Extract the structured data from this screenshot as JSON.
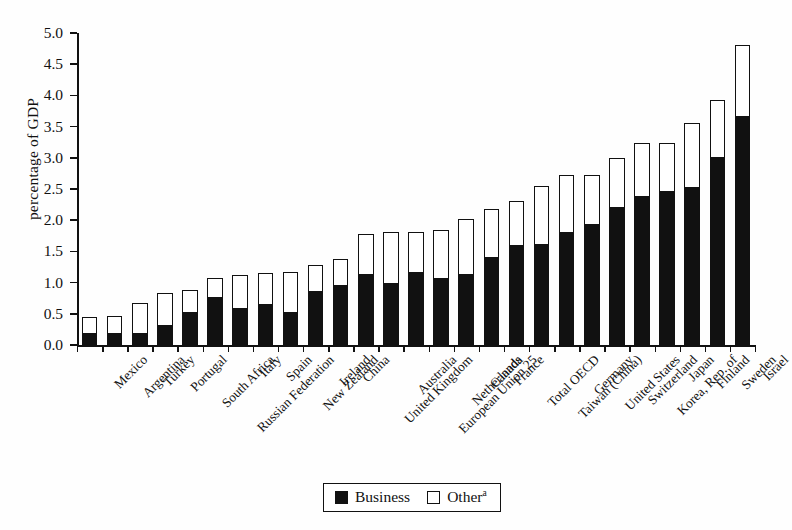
{
  "chart_data": {
    "type": "bar",
    "subtype": "stacked-vertical",
    "title": "",
    "xlabel": "",
    "ylabel": "percentage of GDP",
    "ylim": [
      0.0,
      5.0
    ],
    "ytick_step": 0.5,
    "ytick_labels": [
      "0.0",
      "0.5",
      "1.0",
      "1.5",
      "2.0",
      "2.5",
      "3.0",
      "3.5",
      "4.0",
      "4.5",
      "5.0"
    ],
    "grid": false,
    "legend_position": "bottom-center",
    "categories": [
      "Mexico",
      "Argentina",
      "Turkey",
      "Portugal",
      "South Africa",
      "Russian Federation",
      "Italy",
      "Spain",
      "New Zealand",
      "Ireland",
      "China",
      "United Kingdom",
      "Australia",
      "European Union 25",
      "Netherlands",
      "Canada",
      "France",
      "Total OECD",
      "Taiwan (China)",
      "Germany",
      "United States",
      "Switzerland",
      "Korea, Rep. of",
      "Japan",
      "Finland",
      "Sweden",
      "Israel"
    ],
    "series": [
      {
        "name": "Business",
        "color": "#111111",
        "values": [
          0.17,
          0.17,
          0.18,
          0.3,
          0.52,
          0.76,
          0.57,
          0.64,
          0.52,
          0.85,
          0.95,
          1.13,
          0.98,
          1.16,
          1.05,
          1.12,
          1.39,
          1.58,
          1.61,
          1.8,
          1.93,
          2.2,
          2.37,
          2.45,
          2.52,
          2.99,
          3.65
        ]
      },
      {
        "name": "Other",
        "color": "#ffffff",
        "values": [
          0.28,
          0.3,
          0.5,
          0.53,
          0.36,
          0.32,
          0.56,
          0.51,
          0.65,
          0.43,
          0.43,
          0.65,
          0.83,
          0.65,
          0.79,
          0.9,
          0.79,
          0.72,
          0.94,
          0.93,
          0.8,
          0.79,
          0.87,
          0.78,
          1.03,
          0.93,
          1.15
        ]
      }
    ],
    "totals": [
      0.45,
      0.47,
      0.68,
      0.83,
      0.88,
      1.08,
      1.13,
      1.15,
      1.17,
      1.28,
      1.38,
      1.78,
      1.81,
      1.81,
      1.84,
      2.02,
      2.18,
      2.3,
      2.55,
      2.73,
      2.73,
      2.99,
      3.24,
      3.23,
      3.55,
      3.92,
      4.8
    ]
  },
  "legend": {
    "items": [
      {
        "label": "Business",
        "swatch": "filled",
        "footnote": ""
      },
      {
        "label": "Other",
        "swatch": "open",
        "footnote": "a"
      }
    ]
  }
}
